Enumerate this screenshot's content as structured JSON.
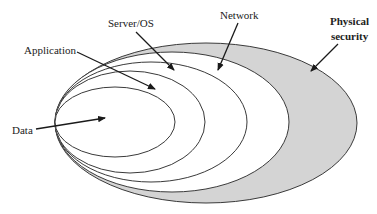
{
  "diagram": {
    "type": "nested-layers",
    "title": "",
    "colors": {
      "outer_fill": "#d4d4d4",
      "inner_fill": "#ffffff",
      "stroke": "#3a3a3a",
      "arrow": "#1a1a1a",
      "text": "#222222"
    },
    "layers": [
      {
        "id": "physical-security",
        "label_lines": [
          "Physical",
          "security"
        ],
        "bold": true,
        "cx": 206,
        "cy": 123,
        "rx": 151,
        "ry": 80,
        "fill": "#d4d4d4",
        "label_x": 330,
        "label_y": 14,
        "arrow": [
          338,
          44,
          311,
          71
        ]
      },
      {
        "id": "network",
        "label_lines": [
          "Network"
        ],
        "bold": false,
        "cx": 172,
        "cy": 122,
        "rx": 117,
        "ry": 70,
        "fill": "#ffffff",
        "label_x": 220,
        "label_y": 9,
        "arrow": [
          238,
          23,
          218,
          70
        ]
      },
      {
        "id": "server-os",
        "label_lines": [
          "Server/OS"
        ],
        "bold": false,
        "cx": 151,
        "cy": 122,
        "rx": 96,
        "ry": 60,
        "fill": "#ffffff",
        "label_x": 108,
        "label_y": 17,
        "arrow": [
          136,
          32,
          174,
          70
        ]
      },
      {
        "id": "application",
        "label_lines": [
          "Application"
        ],
        "bold": false,
        "cx": 130,
        "cy": 122,
        "rx": 75,
        "ry": 51,
        "fill": "#ffffff",
        "label_x": 24,
        "label_y": 44,
        "arrow": [
          77,
          52,
          155,
          89
        ]
      },
      {
        "id": "data",
        "label_lines": [
          "Data"
        ],
        "bold": false,
        "cx": 115,
        "cy": 122,
        "rx": 60,
        "ry": 35,
        "fill": "#ffffff",
        "label_x": 12,
        "label_y": 124,
        "arrow": [
          36,
          129,
          105,
          118
        ]
      }
    ]
  }
}
